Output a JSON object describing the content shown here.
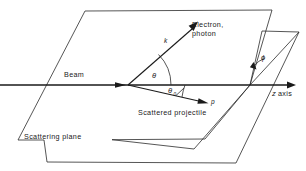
{
  "figure": {
    "kind": "scattering-geometry-diagram",
    "background_color": "#ffffff",
    "line_color": "#1a1a1a",
    "plane_edge_color": "#2b2b2b"
  },
  "labels": {
    "beam": "Beam",
    "electron_photon_line1": "Electron,",
    "electron_photon_line2": "photon",
    "scattered_projectile": "Scattered projectile",
    "scattering_plane": "Scattering plane",
    "z_axis_symbol": "z",
    "z_axis_word": "axis",
    "vector_k": "k",
    "vector_p": "p",
    "angle_theta": "θ",
    "angle_theta0_symbol": "θ",
    "angle_theta0_subscript": "0",
    "angle_phi": "ϕ"
  },
  "geometry": {
    "scattering_plane_points": "85,11 272,10 205,139 18,140",
    "detector_plane_points": "250,85 296,45 296,45 236,163",
    "beam_start_x": 0,
    "beam_end_x": 296,
    "beam_y": 85,
    "origin_x": 128,
    "origin_y": 85,
    "k_tip_x": 197,
    "k_tip_y": 25,
    "p_tip_x": 208,
    "p_tip_y": 104,
    "phi_vertex_x": 250,
    "phi_vertex_y": 85
  }
}
